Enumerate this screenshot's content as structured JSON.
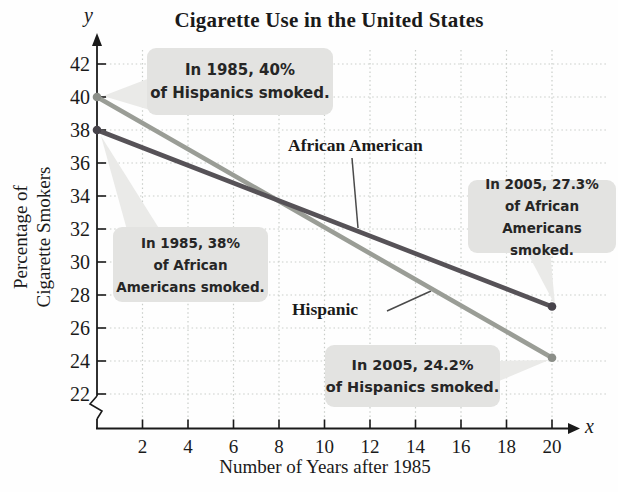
{
  "chart": {
    "axis_letter_x": "x",
    "axis_letter_y": "y"
  },
  "chart_data": {
    "type": "line",
    "title": "Cigarette Use in the United States",
    "xlabel": "Number of Years after 1985",
    "ylabel": "Percentage of Cigarette Smokers",
    "ylabel_lines": [
      "Percentage of",
      "Cigarette Smokers"
    ],
    "x": [
      0,
      20
    ],
    "series": [
      {
        "name": "African American",
        "values": [
          38,
          27.3
        ],
        "color": "#565257",
        "dot_color": "#47434a"
      },
      {
        "name": "Hispanic",
        "values": [
          40,
          24.2
        ],
        "color": "#9a9d96",
        "dot_color": "#8b8e88"
      }
    ],
    "xlim": [
      0,
      20
    ],
    "ylim": [
      22,
      42
    ],
    "x_ticks": [
      2,
      4,
      6,
      8,
      10,
      12,
      14,
      16,
      18,
      20
    ],
    "y_ticks": [
      22,
      24,
      26,
      28,
      30,
      32,
      34,
      36,
      38,
      40,
      42
    ],
    "grid": true,
    "grid_style": "dotted",
    "axis_break_y": true,
    "legend_position": "inline-labels"
  },
  "annotations": {
    "callouts": [
      {
        "id": "hispanic-1985",
        "lines": [
          "In 1985, 40%",
          "of Hispanics smoked."
        ]
      },
      {
        "id": "african-1985",
        "lines": [
          "In 1985, 38%",
          "of African",
          "Americans smoked."
        ]
      },
      {
        "id": "african-2005",
        "lines": [
          "In 2005, 27.3%",
          "of African",
          "Americans smoked."
        ]
      },
      {
        "id": "hispanic-2005",
        "lines": [
          "In 2005, 24.2%",
          "of Hispanics smoked."
        ]
      }
    ]
  },
  "colors": {
    "callout_bg": "#e3e3e1",
    "callout_tail": "#eaeae8",
    "gridline": "#c9cdc9",
    "axis": "#1a1a1a",
    "leader_line": "#4a4a4a"
  }
}
